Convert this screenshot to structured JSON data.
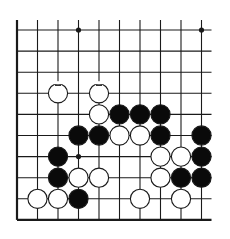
{
  "diagram": {
    "type": "go-board-fragment",
    "grid": {
      "cols": 10,
      "rows": 10,
      "origin_x": 17,
      "origin_y": 30,
      "spacing_x": 20.5,
      "spacing_y": 21.1,
      "top_extend": 10,
      "right_extend": 10,
      "edges": [
        "left",
        "bottom"
      ]
    },
    "star_points": [
      [
        3,
        0
      ],
      [
        9,
        0
      ],
      [
        3,
        6
      ]
    ],
    "stones": [
      {
        "col": 2,
        "row": 3,
        "color": "white",
        "marked": true
      },
      {
        "col": 4,
        "row": 3,
        "color": "white",
        "marked": true
      },
      {
        "col": 4,
        "row": 4,
        "color": "white"
      },
      {
        "col": 5,
        "row": 4,
        "color": "black"
      },
      {
        "col": 6,
        "row": 4,
        "color": "black"
      },
      {
        "col": 7,
        "row": 4,
        "color": "black"
      },
      {
        "col": 3,
        "row": 5,
        "color": "black"
      },
      {
        "col": 4,
        "row": 5,
        "color": "black"
      },
      {
        "col": 5,
        "row": 5,
        "color": "white"
      },
      {
        "col": 6,
        "row": 5,
        "color": "white"
      },
      {
        "col": 7,
        "row": 5,
        "color": "black"
      },
      {
        "col": 9,
        "row": 5,
        "color": "black"
      },
      {
        "col": 2,
        "row": 6,
        "color": "black"
      },
      {
        "col": 7,
        "row": 6,
        "color": "white"
      },
      {
        "col": 8,
        "row": 6,
        "color": "white"
      },
      {
        "col": 9,
        "row": 6,
        "color": "black"
      },
      {
        "col": 2,
        "row": 7,
        "color": "black"
      },
      {
        "col": 3,
        "row": 7,
        "color": "white"
      },
      {
        "col": 4,
        "row": 7,
        "color": "white"
      },
      {
        "col": 7,
        "row": 7,
        "color": "white"
      },
      {
        "col": 8,
        "row": 7,
        "color": "black"
      },
      {
        "col": 9,
        "row": 7,
        "color": "black"
      },
      {
        "col": 1,
        "row": 8,
        "color": "white"
      },
      {
        "col": 2,
        "row": 8,
        "color": "white"
      },
      {
        "col": 3,
        "row": 8,
        "color": "black"
      },
      {
        "col": 6,
        "row": 8,
        "color": "white"
      },
      {
        "col": 8,
        "row": 8,
        "color": "white"
      }
    ],
    "colors": {
      "line": "#1a1a1a",
      "black_stone": "#0a0a0a",
      "white_stone": "#ffffff",
      "background": "#ffffff"
    }
  }
}
